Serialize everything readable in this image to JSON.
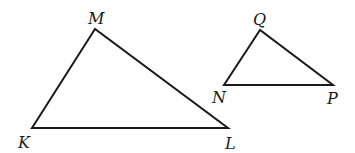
{
  "diagram": {
    "type": "similar-triangles",
    "triangles": [
      {
        "name": "KLM",
        "vertices": [
          {
            "label": "M",
            "x": 95,
            "y": 29,
            "lx": 88,
            "ly": 24
          },
          {
            "label": "K",
            "x": 32,
            "y": 128,
            "lx": 18,
            "ly": 148
          },
          {
            "label": "L",
            "x": 228,
            "y": 128,
            "lx": 225,
            "ly": 149
          }
        ]
      },
      {
        "name": "NPQ",
        "vertices": [
          {
            "label": "Q",
            "x": 260,
            "y": 30,
            "lx": 253,
            "ly": 25
          },
          {
            "label": "N",
            "x": 224,
            "y": 85,
            "lx": 212,
            "ly": 103
          },
          {
            "label": "P",
            "x": 333,
            "y": 85,
            "lx": 327,
            "ly": 104
          }
        ]
      }
    ]
  },
  "labels": {
    "M": "M",
    "K": "K",
    "L": "L",
    "Q": "Q",
    "N": "N",
    "P": "P"
  }
}
